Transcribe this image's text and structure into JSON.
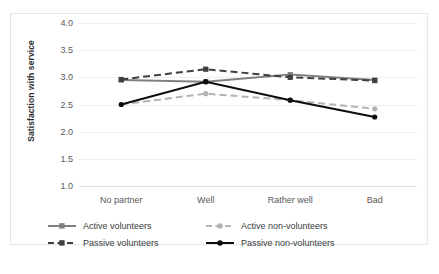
{
  "chart_data": {
    "type": "line",
    "title": "",
    "xlabel": "",
    "ylabel": "Satisfaction with service",
    "categories": [
      "No partner",
      "Well",
      "Rather well",
      "Bad"
    ],
    "ylim": [
      1.0,
      4.0
    ],
    "yticks": [
      "4.0",
      "3.5",
      "3.0",
      "2.5",
      "2.0",
      "1.5",
      "1.0"
    ],
    "ytick_values": [
      4.0,
      3.5,
      3.0,
      2.5,
      2.0,
      1.5,
      1.0
    ],
    "grid": true,
    "legend_position": "bottom",
    "series": [
      {
        "name": "Active volunteers",
        "values": [
          2.95,
          2.92,
          3.05,
          2.95
        ],
        "color": "#808080",
        "style": "solid",
        "marker": "square"
      },
      {
        "name": "Active non-volunteers",
        "values": [
          2.5,
          2.7,
          2.58,
          2.42
        ],
        "color": "#b3b3b3",
        "style": "dashed",
        "marker": "circle"
      },
      {
        "name": "Passive volunteers",
        "values": [
          2.96,
          3.15,
          3.0,
          2.94
        ],
        "color": "#3f3f3f",
        "style": "dashed",
        "marker": "square"
      },
      {
        "name": "Passive non-volunteers",
        "values": [
          2.5,
          2.92,
          2.58,
          2.27
        ],
        "color": "#0d0d0d",
        "style": "solid",
        "marker": "circle"
      }
    ]
  },
  "legend": {
    "items": [
      {
        "label": "Active volunteers"
      },
      {
        "label": "Active non-volunteers"
      },
      {
        "label": "Passive volunteers"
      },
      {
        "label": "Passive non-volunteers"
      }
    ],
    "order": [
      0,
      1,
      2,
      3
    ]
  },
  "colors": {
    "gridline": "#eeeeee",
    "axis": "#dcdcdc",
    "tick_text": "#59595b",
    "title_text": "#2b2b2b",
    "frame": "#e6e6e6",
    "background": "#ffffff"
  }
}
